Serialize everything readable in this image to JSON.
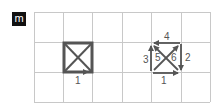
{
  "panel_label": "m",
  "colors": {
    "grid": "#c8c8c8",
    "stroke": "#555555",
    "badge_bg": "#111111",
    "badge_fg": "#ffffff"
  },
  "grid": {
    "columns": 6,
    "rows": 3,
    "x_lines": [
      34,
      63,
      92,
      122,
      151,
      181,
      210
    ],
    "y_lines": [
      12,
      42,
      72,
      102
    ]
  },
  "left_figure": {
    "description": "square with both diagonals",
    "edge_labels": [
      {
        "text": "1",
        "position": "bottom"
      }
    ]
  },
  "right_figure": {
    "description": "square with directed edges and diagonals",
    "edge_labels": [
      {
        "text": "1",
        "position": "bottom"
      },
      {
        "text": "2",
        "position": "right"
      },
      {
        "text": "3",
        "position": "left"
      },
      {
        "text": "4",
        "position": "top"
      },
      {
        "text": "5",
        "position": "diagonal-left"
      },
      {
        "text": "6",
        "position": "diagonal-right"
      }
    ]
  }
}
